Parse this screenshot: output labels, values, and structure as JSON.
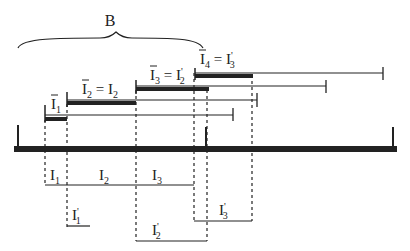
{
  "diagram": {
    "brace_label": "B",
    "colors": {
      "ink": "#222222",
      "background": "#ffffff"
    },
    "intervals_top": [
      {
        "id": "bar1",
        "label_main": "I",
        "label_sub": "1",
        "overline": true,
        "equals": ""
      },
      {
        "id": "bar2",
        "label_main": "I",
        "label_sub": "2",
        "overline": true,
        "equals": "= I",
        "equals_sub": "2",
        "equals_prime": ""
      },
      {
        "id": "bar3",
        "label_main": "I",
        "label_sub": "3",
        "overline": true,
        "equals": "= I",
        "equals_sub": "2",
        "equals_prime": "'"
      },
      {
        "id": "bar4",
        "label_main": "I",
        "label_sub": "4",
        "overline": true,
        "equals": "= I",
        "equals_sub": "3",
        "equals_prime": "'"
      }
    ],
    "segments_bottom": [
      {
        "label_main": "I",
        "label_sub": "1"
      },
      {
        "label_main": "I",
        "label_sub": "2"
      },
      {
        "label_main": "I",
        "label_sub": "3"
      }
    ],
    "segments_prime": [
      {
        "label_main": "I",
        "label_sub": "1",
        "prime": "'"
      },
      {
        "label_main": "I",
        "label_sub": "2",
        "prime": "'"
      },
      {
        "label_main": "I",
        "label_sub": "3",
        "prime": "'"
      }
    ]
  }
}
